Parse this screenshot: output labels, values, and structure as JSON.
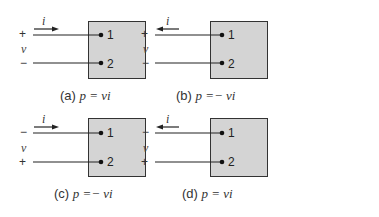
{
  "panels": [
    {
      "id": "a",
      "caption_prefix": "(a)",
      "caption_math": "p = vi",
      "current_label": "i",
      "current_direction": "right",
      "top_sign": "+",
      "bottom_sign": "−",
      "voltage_label": "v",
      "terminal_top": "1",
      "terminal_bottom": "2"
    },
    {
      "id": "b",
      "caption_prefix": "(b)",
      "caption_math": "p =− vi",
      "current_label": "i",
      "current_direction": "left",
      "top_sign": "+",
      "bottom_sign": "−",
      "voltage_label": "v",
      "terminal_top": "1",
      "terminal_bottom": "2"
    },
    {
      "id": "c",
      "caption_prefix": "(c)",
      "caption_math": "p =− vi",
      "current_label": "i",
      "current_direction": "right",
      "top_sign": "−",
      "bottom_sign": "+",
      "voltage_label": "v",
      "terminal_top": "1",
      "terminal_bottom": "2"
    },
    {
      "id": "d",
      "caption_prefix": "(d)",
      "caption_math": "p = vi",
      "current_label": "i",
      "current_direction": "left",
      "top_sign": "−",
      "bottom_sign": "+",
      "voltage_label": "v",
      "terminal_top": "1",
      "terminal_bottom": "2"
    }
  ],
  "colors": {
    "box_fill": "#d4d4d4",
    "line": "#222222"
  }
}
